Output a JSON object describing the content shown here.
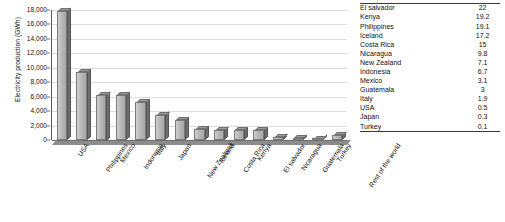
{
  "chart_data": {
    "type": "bar",
    "title": "",
    "xlabel": "",
    "ylabel": "Electricity production (GWh)",
    "ylim": [
      0,
      18000
    ],
    "ytick_labels": [
      "18,000",
      "16,000",
      "14,000",
      "12,000",
      "10,000",
      "8,000",
      "6,000",
      "4,000",
      "2,000",
      "0"
    ],
    "ytick_values": [
      18000,
      16000,
      14000,
      12000,
      10000,
      8000,
      6000,
      4000,
      2000,
      0
    ],
    "grid": true,
    "legend": "none",
    "categories": [
      "USA",
      "Philippines",
      "Mexico",
      "Indonesia",
      "Italy",
      "Japan",
      "New Zealand",
      "Iceland",
      "Costa Rica",
      "Kenya",
      "El salvador",
      "Nicaragua",
      "Guatemala",
      "Turkey",
      "Rest of the world"
    ],
    "values": [
      17900,
      9400,
      6300,
      6200,
      5300,
      3500,
      2800,
      1500,
      1400,
      1400,
      1400,
      400,
      300,
      100,
      700
    ]
  },
  "table": {
    "rows": [
      {
        "country": "El salvador",
        "value": "22"
      },
      {
        "country": "Kenya",
        "value": "19.2"
      },
      {
        "country": "Philippines",
        "value": "19.1"
      },
      {
        "country": "Iceland",
        "value": "17.2"
      },
      {
        "country": "Costa Rica",
        "value": "15"
      },
      {
        "country": "Nicaragua",
        "value": "9.8"
      },
      {
        "country": "New Zealand",
        "value": "7.1"
      },
      {
        "country": "Indonesia",
        "value": "6.7"
      },
      {
        "country": "Mexico",
        "value": "3.1"
      },
      {
        "country": "Guatemala",
        "value": "3"
      },
      {
        "country": "Italy",
        "value": "1.9"
      },
      {
        "country": "USA",
        "value": "0.5"
      },
      {
        "country": "Japan",
        "value": "0.3"
      },
      {
        "country": "Turkey",
        "value": "0.1"
      }
    ]
  },
  "caption": {
    "text": ""
  },
  "colors": {
    "bar_front": "#b4b4b4",
    "bar_side": "#6d6d6d",
    "gridline": "#dcdcdc",
    "axis": "#555555",
    "text": "#111111"
  }
}
